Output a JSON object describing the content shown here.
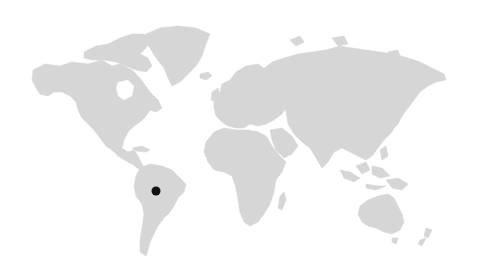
{
  "map": {
    "type": "world-map",
    "land_color": "#d6d6d6",
    "background_color": "#ffffff",
    "markers": [
      {
        "region": "South America (central Brazil / Amazon)",
        "x": 156,
        "y": 191,
        "diameter": 9,
        "color": "#111111"
      }
    ]
  }
}
